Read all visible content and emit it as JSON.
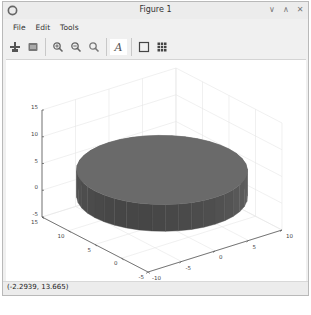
{
  "window": {
    "title": "Figure 1",
    "controls": [
      {
        "name": "minimize",
        "glyph": "∨"
      },
      {
        "name": "maximize",
        "glyph": "∧"
      },
      {
        "name": "close",
        "glyph": "✕"
      }
    ]
  },
  "menu": {
    "items": [
      {
        "label": "File"
      },
      {
        "label": "Edit"
      },
      {
        "label": "Tools"
      }
    ]
  },
  "toolbar": {
    "buttons": [
      {
        "icon": "rotate-icon",
        "tooltip": "Rotate"
      },
      {
        "icon": "reset-view-icon",
        "tooltip": "Reset view"
      },
      {
        "icon": "zoom-in-icon",
        "tooltip": "Zoom in"
      },
      {
        "icon": "zoom-out-icon",
        "tooltip": "Zoom out"
      },
      {
        "icon": "zoom-icon",
        "tooltip": "Zoom"
      },
      {
        "icon": "text-icon",
        "tooltip": "Insert text",
        "glyph": "A"
      },
      {
        "icon": "axes-box-icon",
        "tooltip": "Toggle box"
      },
      {
        "icon": "grid-icon",
        "tooltip": "Toggle grid"
      }
    ]
  },
  "status": {
    "coordinates": "(-2.2939, 13.665)"
  },
  "chart_data": {
    "type": "surface3d",
    "title": "",
    "xlabel": "",
    "ylabel": "",
    "zlabel": "",
    "x_ticks": [
      "-10",
      "-5",
      "0",
      "5",
      "10"
    ],
    "y_ticks": [
      "-5",
      "0",
      "5",
      "10",
      "15"
    ],
    "z_ticks": [
      "-5",
      "0",
      "5",
      "10",
      "15"
    ],
    "xlim": [
      -10,
      10
    ],
    "ylim": [
      -5,
      15
    ],
    "zlim": [
      -5,
      15
    ],
    "grid": true,
    "surface": {
      "shape": "cylinder",
      "center": [
        0,
        5
      ],
      "radius": 10,
      "z_range": [
        0,
        5
      ],
      "color": "#6a6a6a"
    }
  }
}
